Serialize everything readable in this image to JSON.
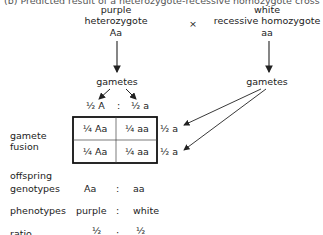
{
  "title": "(b) Predicted result of a heterozygote-recessive homozygote cross",
  "parent1": {
    "phenotype": "purple",
    "type": "heterozygote",
    "genotype": "Aa"
  },
  "cross_symbol": "×",
  "parent2": {
    "phenotype": "white",
    "type": "recessive homozygote",
    "genotype": "aa"
  },
  "gametes_label": "gametes",
  "parent1_gametes": {
    "left": "½ A",
    "sep": ":",
    "right": "½ a"
  },
  "parent2_gametes": [
    "½ a",
    "½ a"
  ],
  "punnett": [
    [
      "¼ Aa",
      "¼ aa"
    ],
    [
      "¼ Aa",
      "¼ aa"
    ]
  ],
  "row_labels": {
    "fusion": [
      "gamete",
      "fusion"
    ],
    "offspring": [
      "offspring",
      "genotypes"
    ],
    "phenotypes": "phenotypes",
    "ratio": "ratio"
  },
  "offspring_genotypes": {
    "left": "Aa",
    "sep": ":",
    "right": "aa"
  },
  "phenotypes": {
    "left": "purple",
    "sep": ":",
    "right": "white"
  },
  "ratio": {
    "left": "½",
    "sep": ":",
    "right": "½"
  }
}
